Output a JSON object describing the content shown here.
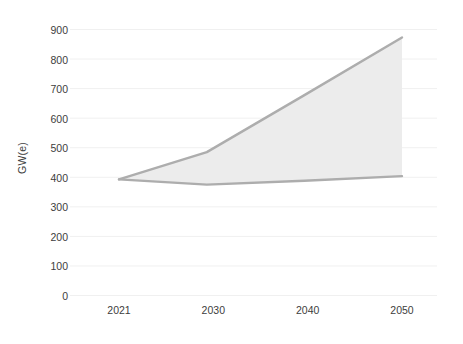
{
  "chart_data": {
    "type": "area",
    "title": "",
    "subtitle": "",
    "xlabel": "",
    "ylabel": "GW(e)",
    "x": [
      2021,
      2030,
      2040,
      2050
    ],
    "x_tick_labels": [
      "2021",
      "2030",
      "2040",
      "2050"
    ],
    "y_tick_labels": [
      "0",
      "100",
      "200",
      "300",
      "400",
      "500",
      "600",
      "700",
      "800",
      "900"
    ],
    "y_ticks": [
      0,
      100,
      200,
      300,
      400,
      500,
      600,
      700,
      800,
      900
    ],
    "ylim": [
      0,
      900
    ],
    "xlim": [
      2021,
      2050
    ],
    "grid": true,
    "grid_axis": "y",
    "legend": false,
    "legend_position": "none",
    "series": [
      {
        "name": "High case",
        "values": [
          393,
          485,
          678,
          873
        ]
      },
      {
        "name": "Low case",
        "values": [
          393,
          375,
          388,
          404
        ]
      }
    ],
    "band": {
      "name": "Projection range",
      "upper": [
        393,
        485,
        678,
        873
      ],
      "lower": [
        393,
        375,
        388,
        404
      ]
    },
    "colors": {
      "line": "#adadad",
      "band_fill": "#ececec",
      "grid": "#f0f0f0",
      "text": "#3d3d3d",
      "background": "#ffffff"
    }
  },
  "axes": {
    "y_axis_title": "GW(e)"
  }
}
